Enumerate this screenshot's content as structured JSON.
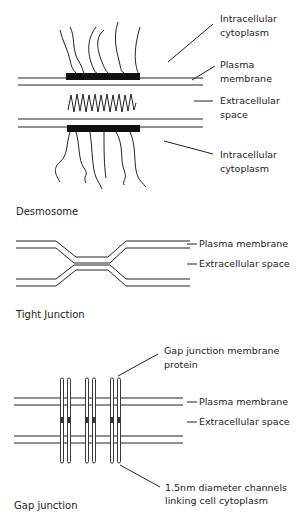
{
  "diagrams": {
    "desmosome": {
      "caption": "Desmosome",
      "labels": {
        "intracellular_top_1": "Intracellular",
        "intracellular_top_2": "cytoplasm",
        "plasma_1": "Plasma",
        "plasma_2": "membrane",
        "extracellular_1": "Extracellular",
        "extracellular_2": "space",
        "intracellular_bottom_1": "Intracellular",
        "intracellular_bottom_2": "cytoplasm"
      }
    },
    "tight_junction": {
      "caption": "Tight Junction",
      "labels": {
        "plasma": "Plasma membrane",
        "extracellular": "Extracellular space"
      }
    },
    "gap_junction": {
      "caption": "Gap junction",
      "labels": {
        "protein_1": "Gap junction membrane",
        "protein_2": "protein",
        "plasma": "Plasma membrane",
        "extracellular": "Extracellular space",
        "channels_1": "1.5nm diameter channels",
        "channels_2": "linking cell cytoplasm"
      }
    }
  }
}
